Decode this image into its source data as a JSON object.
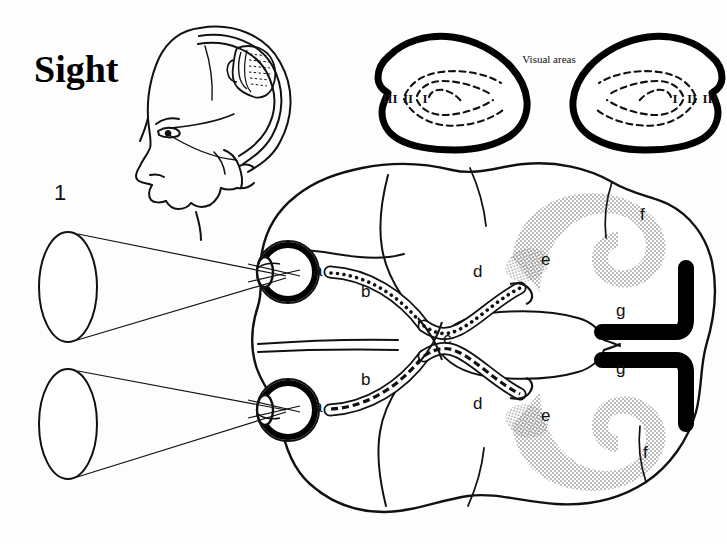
{
  "page": {
    "title": "Sight",
    "background_color": "#fdfdfd",
    "ink_color": "#000000",
    "width": 727,
    "height": 544
  },
  "figure": {
    "kind": "anatomical-diagram"
  },
  "head_inset": {
    "name": "head-profile-with-brain",
    "description": "side view of a human head showing the brain and striated visual cortex region"
  },
  "visual_areas_panel": {
    "label": "Visual areas",
    "left_hemisphere": {
      "numerals": [
        "III",
        "II",
        "I"
      ]
    },
    "right_hemisphere": {
      "numerals": [
        "I",
        "II",
        "III"
      ]
    }
  },
  "field_markers": {
    "upper_field_number": "1"
  },
  "pathway_labels": [
    {
      "key": "a",
      "text": "a",
      "x": 313,
      "y": 276,
      "desc": "retina"
    },
    {
      "key": "a2",
      "text": "a",
      "x": 313,
      "y": 412,
      "desc": "retina-lower"
    },
    {
      "key": "b",
      "text": "b",
      "x": 361,
      "y": 297,
      "desc": "optic-nerve"
    },
    {
      "key": "b2",
      "text": "b",
      "x": 361,
      "y": 385,
      "desc": "optic-nerve-lower"
    },
    {
      "key": "c",
      "text": "c",
      "x": 443,
      "y": 344,
      "desc": "optic-chiasm"
    },
    {
      "key": "d",
      "text": "d",
      "x": 473,
      "y": 277,
      "desc": "optic-tract"
    },
    {
      "key": "d2",
      "text": "d",
      "x": 473,
      "y": 409,
      "desc": "optic-tract-lower"
    },
    {
      "key": "e",
      "text": "e",
      "x": 541,
      "y": 265,
      "desc": "lateral-geniculate"
    },
    {
      "key": "e2",
      "text": "e",
      "x": 541,
      "y": 421,
      "desc": "lateral-geniculate-lower"
    },
    {
      "key": "f",
      "text": "f",
      "x": 640,
      "y": 220,
      "desc": "optic-radiation"
    },
    {
      "key": "f2",
      "text": "f",
      "x": 643,
      "y": 458,
      "desc": "optic-radiation-lower"
    },
    {
      "key": "g",
      "text": "g",
      "x": 616,
      "y": 316,
      "desc": "visual-cortex"
    },
    {
      "key": "g2",
      "text": "g",
      "x": 616,
      "y": 374,
      "desc": "visual-cortex-lower"
    }
  ]
}
